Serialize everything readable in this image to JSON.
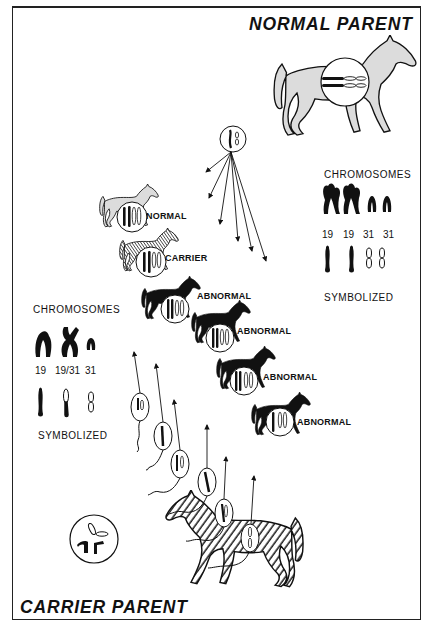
{
  "diagram": {
    "type": "genetics-illustration"
  },
  "titles": {
    "normal_parent": "NORMAL PARENT",
    "carrier_parent": "CARRIER PARENT"
  },
  "normal_parent_key": {
    "heading": "CHROMOSOMES",
    "numbers": [
      "19",
      "19",
      "31",
      "31"
    ],
    "footer": "SYMBOLIZED"
  },
  "carrier_parent_key": {
    "heading": "CHROMOSOMES",
    "numbers": [
      "19",
      "19/31",
      "31"
    ],
    "footer": "SYMBOLIZED"
  },
  "offspring": [
    {
      "label": "NORMAL",
      "fill": "light-gray"
    },
    {
      "label": "CARRIER",
      "fill": "hatched"
    },
    {
      "label": "ABNORMAL",
      "fill": "black"
    },
    {
      "label": "ABNORMAL",
      "fill": "black"
    },
    {
      "label": "ABNORMAL",
      "fill": "black"
    },
    {
      "label": "ABNORMAL",
      "fill": "black"
    }
  ],
  "colors": {
    "ink": "#111111",
    "light_fill": "#dcdcdc",
    "background": "#ffffff"
  }
}
